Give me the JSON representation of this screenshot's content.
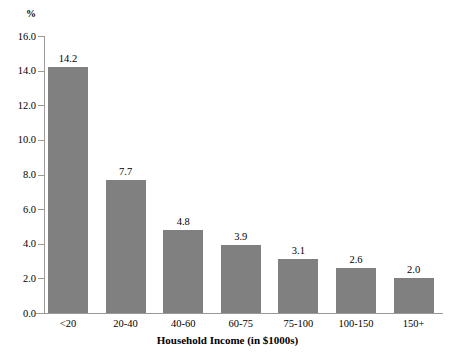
{
  "chart_data": {
    "type": "bar",
    "title": "",
    "subtitle": "",
    "categories": [
      "<20",
      "20-40",
      "40-60",
      "60-75",
      "75-100",
      "100-150",
      "150+"
    ],
    "values": [
      14.2,
      7.7,
      4.8,
      3.9,
      3.1,
      2.6,
      2.0
    ],
    "value_labels": [
      "14.2",
      "7.7",
      "4.8",
      "3.9",
      "3.1",
      "2.6",
      "2.0"
    ],
    "xlabel": "Household Income (in $1000s)",
    "ylabel": "%",
    "ylim": [
      0.0,
      16.0
    ],
    "ytick_step": 2.0,
    "ytick_labels": [
      "16.0",
      "14.0",
      "12.0",
      "10.0",
      "8.0",
      "6.0",
      "4.0",
      "2.0",
      "0.0"
    ],
    "ytick_values": [
      16.0,
      14.0,
      12.0,
      10.0,
      8.0,
      6.0,
      4.0,
      2.0,
      0.0
    ],
    "grid": false,
    "legend": false,
    "legend_position": "none",
    "bar_color": "#808080",
    "axis_color": "#9a9a9a",
    "background_color": "#ffffff",
    "text_color": "#000000"
  }
}
